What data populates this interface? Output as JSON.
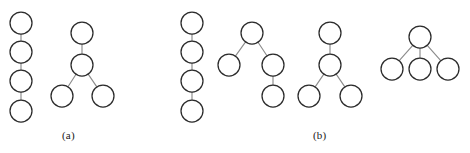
{
  "figure": {
    "width": 470,
    "height": 153,
    "background_color": "#ffffff",
    "node_radius": 11,
    "node_fill_color": "#ffffff",
    "node_stroke_color": "#2b2b2b",
    "edge_stroke_color": "#8c8c8c"
  },
  "panels": [
    {
      "id": "panel-a",
      "label": "(a)",
      "label_x": 62,
      "label_y": 129,
      "trees": [
        {
          "id": "a-tree-1",
          "shape": "path-chain-4",
          "nodes": [
            {
              "id": "a1n1",
              "cx": 21,
              "cy": 23
            },
            {
              "id": "a1n2",
              "cx": 21,
              "cy": 52
            },
            {
              "id": "a1n3",
              "cx": 21,
              "cy": 81
            },
            {
              "id": "a1n4",
              "cx": 21,
              "cy": 111
            }
          ],
          "edges": [
            {
              "from": "a1n1",
              "to": "a1n2"
            },
            {
              "from": "a1n2",
              "to": "a1n3"
            },
            {
              "from": "a1n3",
              "to": "a1n4"
            }
          ]
        },
        {
          "id": "a-tree-2",
          "shape": "root-child-two-grandchildren",
          "nodes": [
            {
              "id": "a2n1",
              "cx": 82,
              "cy": 33
            },
            {
              "id": "a2n2",
              "cx": 82,
              "cy": 65
            },
            {
              "id": "a2n3",
              "cx": 62,
              "cy": 96
            },
            {
              "id": "a2n4",
              "cx": 103,
              "cy": 96
            }
          ],
          "edges": [
            {
              "from": "a2n1",
              "to": "a2n2"
            },
            {
              "from": "a2n2",
              "to": "a2n3"
            },
            {
              "from": "a2n2",
              "to": "a2n4"
            }
          ]
        }
      ]
    },
    {
      "id": "panel-b",
      "label": "(b)",
      "label_x": 313,
      "label_y": 129,
      "trees": [
        {
          "id": "b-tree-1",
          "shape": "path-chain-4",
          "nodes": [
            {
              "id": "b1n1",
              "cx": 192,
              "cy": 23
            },
            {
              "id": "b1n2",
              "cx": 192,
              "cy": 52
            },
            {
              "id": "b1n3",
              "cx": 192,
              "cy": 81
            },
            {
              "id": "b1n4",
              "cx": 192,
              "cy": 111
            }
          ],
          "edges": [
            {
              "from": "b1n1",
              "to": "b1n2"
            },
            {
              "from": "b1n2",
              "to": "b1n3"
            },
            {
              "from": "b1n3",
              "to": "b1n4"
            }
          ]
        },
        {
          "id": "b-tree-2",
          "shape": "root-two-children-right-has-child",
          "nodes": [
            {
              "id": "b2n1",
              "cx": 252,
              "cy": 33
            },
            {
              "id": "b2n2",
              "cx": 229,
              "cy": 65
            },
            {
              "id": "b2n3",
              "cx": 273,
              "cy": 65
            },
            {
              "id": "b2n4",
              "cx": 273,
              "cy": 96
            }
          ],
          "edges": [
            {
              "from": "b2n1",
              "to": "b2n2"
            },
            {
              "from": "b2n1",
              "to": "b2n3"
            },
            {
              "from": "b2n3",
              "to": "b2n4"
            }
          ]
        },
        {
          "id": "b-tree-3",
          "shape": "root-child-two-grandchildren",
          "nodes": [
            {
              "id": "b3n1",
              "cx": 330,
              "cy": 33
            },
            {
              "id": "b3n2",
              "cx": 330,
              "cy": 65
            },
            {
              "id": "b3n3",
              "cx": 309,
              "cy": 96
            },
            {
              "id": "b3n4",
              "cx": 351,
              "cy": 96
            }
          ],
          "edges": [
            {
              "from": "b3n1",
              "to": "b3n2"
            },
            {
              "from": "b3n2",
              "to": "b3n3"
            },
            {
              "from": "b3n2",
              "to": "b3n4"
            }
          ]
        },
        {
          "id": "b-tree-4",
          "shape": "star-root-three-children",
          "nodes": [
            {
              "id": "b4n1",
              "cx": 420,
              "cy": 37
            },
            {
              "id": "b4n2",
              "cx": 392,
              "cy": 69
            },
            {
              "id": "b4n3",
              "cx": 420,
              "cy": 69
            },
            {
              "id": "b4n4",
              "cx": 448,
              "cy": 69
            }
          ],
          "edges": [
            {
              "from": "b4n1",
              "to": "b4n2"
            },
            {
              "from": "b4n1",
              "to": "b4n3"
            },
            {
              "from": "b4n1",
              "to": "b4n4"
            }
          ]
        }
      ]
    }
  ]
}
